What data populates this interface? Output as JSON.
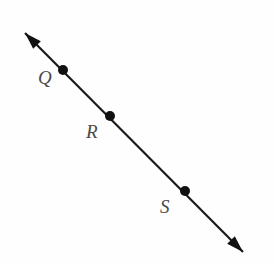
{
  "figure": {
    "type": "geometry-line-diagram",
    "background_color": "#fefefe",
    "line": {
      "name": "line-QS",
      "color": "#1a1a1a",
      "stroke_width": 2.2,
      "start_point": {
        "x": 25,
        "y": 33
      },
      "end_point": {
        "x": 243,
        "y": 252
      },
      "arrowhead_start": true,
      "arrowhead_end": true,
      "arrowhead_color": "#111111"
    },
    "points": [
      {
        "id": "Q",
        "label": "Q",
        "dot_x": 63,
        "dot_y": 70,
        "dot_radius": 5,
        "dot_color": "#111111",
        "label_x": 38,
        "label_y": 68,
        "label_color": "#4a4a4a"
      },
      {
        "id": "R",
        "label": "R",
        "dot_x": 110,
        "dot_y": 116,
        "dot_radius": 5,
        "dot_color": "#111111",
        "label_x": 86,
        "label_y": 122,
        "label_color": "#4a4a4a"
      },
      {
        "id": "S",
        "label": "S",
        "dot_x": 185,
        "dot_y": 191,
        "dot_radius": 5,
        "dot_color": "#111111",
        "label_x": 160,
        "label_y": 197,
        "label_color": "#4a4a4a"
      }
    ]
  }
}
